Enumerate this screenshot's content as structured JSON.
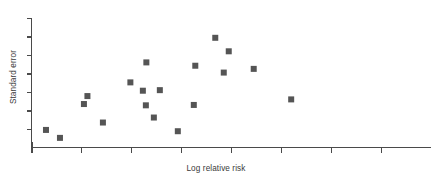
{
  "chart_data": {
    "type": "scatter",
    "title": "",
    "xlabel": "Log relative risk",
    "ylabel": "Standard error",
    "grid": false,
    "legend": null,
    "y_axis_inverted": true,
    "xlim": [
      0,
      8
    ],
    "ylim": [
      0,
      7
    ],
    "x_tick_count": 8,
    "y_tick_count": 7,
    "x_tick_labels": [
      "",
      "",
      "",
      "",
      "",
      "",
      "",
      ""
    ],
    "y_tick_labels": [
      "",
      "",
      "",
      "",
      "",
      "",
      ""
    ],
    "marker": {
      "shape": "square",
      "size_px": 6,
      "color": "#555555"
    },
    "n_points": 19,
    "points": [
      {
        "x": 0.29,
        "y": 0.95
      },
      {
        "x": 0.57,
        "y": 0.52
      },
      {
        "x": 1.05,
        "y": 2.35
      },
      {
        "x": 1.12,
        "y": 2.78
      },
      {
        "x": 1.43,
        "y": 1.35
      },
      {
        "x": 1.98,
        "y": 3.52
      },
      {
        "x": 2.23,
        "y": 3.07
      },
      {
        "x": 2.3,
        "y": 4.6
      },
      {
        "x": 2.29,
        "y": 2.28
      },
      {
        "x": 2.45,
        "y": 1.62
      },
      {
        "x": 2.57,
        "y": 3.1
      },
      {
        "x": 2.93,
        "y": 0.88
      },
      {
        "x": 3.25,
        "y": 2.3
      },
      {
        "x": 3.28,
        "y": 4.42
      },
      {
        "x": 3.68,
        "y": 5.93
      },
      {
        "x": 3.85,
        "y": 4.05
      },
      {
        "x": 3.95,
        "y": 5.2
      },
      {
        "x": 4.45,
        "y": 4.25
      },
      {
        "x": 5.2,
        "y": 2.6
      }
    ]
  },
  "axes": {
    "x_label": "Log relative risk",
    "y_label": "Standard error"
  }
}
